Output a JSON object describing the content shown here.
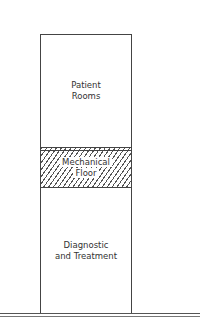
{
  "diagram": {
    "type": "building-section",
    "zones": [
      {
        "label_line1": "Patient",
        "label_line2": "Rooms",
        "pattern": "none"
      },
      {
        "label_line1": "Mechanical",
        "label_line2": "Floor",
        "pattern": "hatched"
      },
      {
        "label_line1": "Diagnostic",
        "label_line2": "and Treatment",
        "pattern": "none"
      }
    ],
    "ground": "double-line"
  }
}
